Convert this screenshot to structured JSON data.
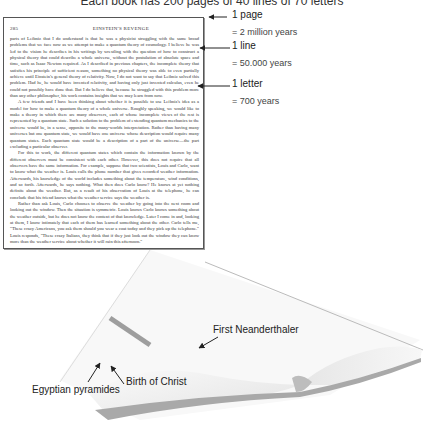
{
  "title": "Each book has 200 pages of 40 lines of 70 letters",
  "page": {
    "number": "285",
    "running_head": "EINSTEIN'S REVENGE",
    "paragraphs": [
      "parts of Leibniz that I do understand is that he was a physicist struggling with the same broad problems that we face now as we attempt to make a quantum theory of cosmology. I believe he was led to the vision he describes in his writings by wrestling with the question of how to construct a physical theory that could describe a whole universe, without the postulation of absolute space and time, such as Isaac Newton required. As I described in previous chapters, the incomplete theory that satisfies his principle of sufficient reason, something no physical theory was able to even partially achieve until Einstein's general theory of relativity. Now, I do not want to say that Leibniz solved this problem. Had he, he would have invented relativity, and having only just invented calculus, even he could not possibly have done that. But I do believe that, because he struggled with this problem more than any other philosopher, his work contains insights that we may learn from now.",
      "A few friends and I have been thinking about whether it is possible to use Leibniz's idea as a model for how to make a quantum theory of a whole universe. Roughly speaking, we would like to make a theory in which there are many observers, each of whose incomplete views of the rest is represented by a quantum state. Such a solution to the problem of extending quantum mechanics to the universe would be, in a sense, opposite to the many-worlds interpretation. Rather than having many universes but one quantum state, we would have one universe whose description would require many quantum states. Each quantum state would be a description of a part of the universe—the part excluding a particular observer.",
      "For this to work, the different quantum states which contain the information known by the different observers must be consistent with each other. However, this does not require that all observers have the same information. For example, suppose that two scientists, Louis and Carlo, want to know what the weather is. Louis calls the phone number that gives recorded weather information. Afterwards, his knowledge of the world includes something about the temperature, wind conditions, and so forth. Afterwards, he says nothing. What then does Carlo know? He knows at yet nothing definite about the weather. But, as a result of his observation of Louis at the telephone, he can conclude that his friend knows what the weather service says the weather is.",
      "Rather than ask Louis, Carlo chooses to observe the weather by going into the next room and looking out the window. Then the situation is symmetric. Louis knows Carlo knows something about the weather outside, but he does not know the content of that knowledge. Later I come in and, looking at them, I know intimately that each of them has learned something about the other. Carlo tells me, \"These crazy Americans, you ask them should you wear a coat today and they pick up the telephone.\" Louis responds, \"These crazy Italians, they think that if they just look out the window they can know more than the weather service about whether it will rain this afternoon.\""
    ]
  },
  "annotations": {
    "page": {
      "label": "1 page",
      "value": "= 2 million years"
    },
    "line": {
      "label": "1 line",
      "value": "= 50.000 years"
    },
    "letter": {
      "label": "1 letter",
      "value": "= 700 years"
    },
    "neanderthal": {
      "label": "First Neanderthaler"
    },
    "pyramids": {
      "label": "Egyptian pyramides"
    },
    "christ": {
      "label": "Birth of Christ"
    }
  },
  "colors": {
    "text": "#222222",
    "book_gray": "#cccccc",
    "book_edge": "#aaaaaa"
  }
}
